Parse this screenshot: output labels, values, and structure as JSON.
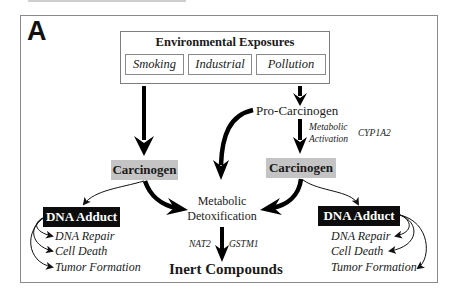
{
  "figure": {
    "panel_label": "A",
    "environmental_exposures": {
      "title": "Environmental Exposures",
      "sources": [
        "Smoking",
        "Industrial",
        "Pollution"
      ]
    },
    "pro_carcinogen": "Pro-Carcinogen",
    "activation": {
      "line1": "Metabolic",
      "line2": "Activation",
      "gene": "CYP1A2"
    },
    "left_branch": {
      "carcinogen": "Carcinogen",
      "adduct": "DNA Adduct",
      "outcomes": [
        "DNA Repair",
        "Cell Death",
        "Tumor Formation"
      ]
    },
    "right_branch": {
      "carcinogen": "Carcinogen",
      "adduct": "DNA Adduct",
      "outcomes": [
        "DNA Repair",
        "Cell Death",
        "Tumor Formation"
      ]
    },
    "detoxification": {
      "line1": "Metabolic",
      "line2": "Detoxification",
      "genes": [
        "NAT2",
        "GSTM1"
      ]
    },
    "end_product": "Inert Compounds",
    "colors": {
      "carcinogen_fill": "#c4c4c4",
      "adduct_fill": "#0d0d0d",
      "arrow": "#000000",
      "frame": "#8a8a8a"
    }
  }
}
